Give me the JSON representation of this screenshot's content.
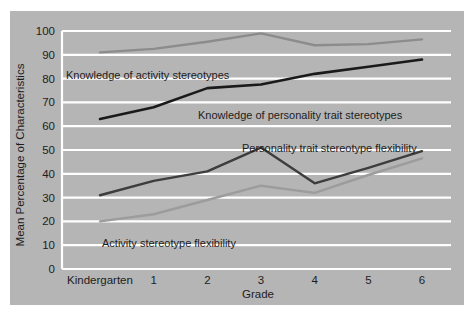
{
  "figure": {
    "background_color": "#b5b5b5",
    "page_background_color": "#ffffff",
    "grid_color": "#ffffff"
  },
  "chart_data": {
    "type": "line",
    "title": "",
    "subtitle": "",
    "xlabel": "Grade",
    "ylabel": "Mean Percentage of Characteristics",
    "categories": [
      "Kindergarten",
      "1",
      "2",
      "3",
      "4",
      "5",
      "6"
    ],
    "ylim": [
      0,
      100
    ],
    "xlim": [
      0,
      6
    ],
    "yticks": [
      "0",
      "10",
      "20",
      "30",
      "40",
      "50",
      "60",
      "70",
      "80",
      "90",
      "100"
    ],
    "grid": true,
    "legend_position": "inline-annotations",
    "series": [
      {
        "name": "Knowledge of activity stereotypes",
        "color": "#8c8c8c",
        "width": 2.4,
        "values": [
          91,
          92.5,
          95.5,
          99,
          94,
          94.5,
          96.5
        ]
      },
      {
        "name": "Knowledge of personality trait stereotypes",
        "color": "#1a1a1a",
        "width": 2.6,
        "values": [
          63,
          68,
          76,
          77.5,
          82,
          85,
          88
        ]
      },
      {
        "name": "Personality trait stereotype flexibility",
        "color": "#3d3d3d",
        "width": 2.4,
        "values": [
          31,
          37,
          41,
          51,
          36,
          42.5,
          49.5
        ]
      },
      {
        "name": "Activity stereotype flexibility",
        "color": "#9c9c9c",
        "width": 2.4,
        "values": [
          20,
          23,
          29,
          35,
          32,
          39.5,
          46.5
        ]
      }
    ],
    "annotations": [
      {
        "text": "Knowledge of activity stereotypes",
        "x": 56,
        "y": 68
      },
      {
        "text": "Knowledge of personality trait stereotypes",
        "x": 188,
        "y": 108
      },
      {
        "text": "Personality trait stereotype flexibility",
        "x": 232,
        "y": 141
      },
      {
        "text": "Activity stereotype flexibility",
        "x": 92,
        "y": 236
      }
    ]
  }
}
